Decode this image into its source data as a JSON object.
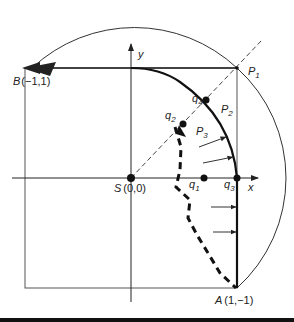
{
  "diagram": {
    "points": {
      "B": {
        "name": "B",
        "coords": "(−1,1)"
      },
      "S": {
        "name": "S",
        "coords": "(0,0)"
      },
      "A": {
        "name": "A",
        "coords": "(1,−1)"
      },
      "P1": {
        "name": "P",
        "sub": "1"
      },
      "P2": {
        "name": "P",
        "sub": "2"
      },
      "P3": {
        "name": "P",
        "sub": "3"
      },
      "q1": {
        "name": "q",
        "sub": "1"
      },
      "q2": {
        "name": "q",
        "sub": "2"
      },
      "q3": {
        "name": "q",
        "sub": "3"
      },
      "q4": {
        "name": "q",
        "sub": "4"
      }
    },
    "axes": {
      "x": "x",
      "y": "y"
    }
  }
}
